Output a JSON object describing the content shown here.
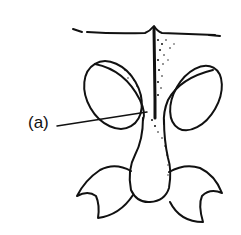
{
  "figure": {
    "labels": [
      {
        "id": "a",
        "text": "(a)"
      }
    ],
    "colors": {
      "stroke": "#111111",
      "background": "#ffffff"
    }
  }
}
